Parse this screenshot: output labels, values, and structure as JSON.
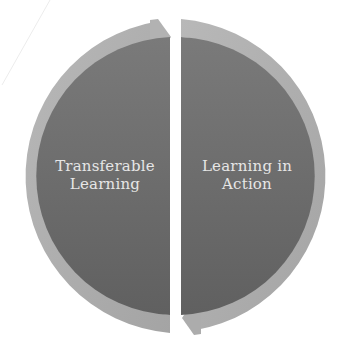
{
  "diagram": {
    "type": "cycle",
    "segments": [
      {
        "label_line1": "Transferable",
        "label_line2": "Learning",
        "arrow_direction": "right"
      },
      {
        "label_line1": "Learning in",
        "label_line2": "Action",
        "arrow_direction": "left"
      }
    ]
  },
  "colors": {
    "background": "#ffffff",
    "fill_top": "#787878",
    "fill_bottom": "#626262",
    "ring": "#b0b0b0",
    "ring_dark": "#9c9c9c",
    "text": "#e6e6e6"
  }
}
